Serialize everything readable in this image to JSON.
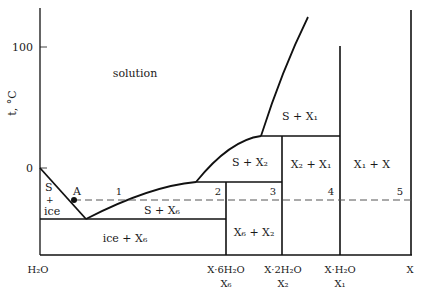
{
  "diagram": {
    "type": "phase-diagram",
    "axis": {
      "y_label": "t, °C",
      "y_ticks": [
        {
          "label": "100",
          "value": 100
        },
        {
          "label": "0",
          "value": 0
        }
      ],
      "x_labels": [
        {
          "formula": "H₂O",
          "symbol": ""
        },
        {
          "formula": "X·6H₂O",
          "symbol": "X₆"
        },
        {
          "formula": "X·2H₂O",
          "symbol": "X₂"
        },
        {
          "formula": "X·H₂O",
          "symbol": "X₁"
        },
        {
          "formula": "X",
          "symbol": ""
        }
      ]
    },
    "regions": {
      "solution": "solution",
      "s_ice_1": "S",
      "s_ice_2": "+",
      "s_ice_3": "ice",
      "ice_x6": "ice + X₆",
      "s_x6": "S + X₆",
      "s_x2": "S + X₂",
      "s_x1": "S + X₁",
      "x6_x2": "X₆ + X₂",
      "x2_x1": "X₂ + X₁",
      "x1_x": "X₁ + X"
    },
    "points": {
      "A": "A",
      "p1": "1",
      "p2": "2",
      "p3": "3",
      "p4": "4",
      "p5": "5"
    },
    "colors": {
      "line": "#111111",
      "dash": "#555555",
      "text": "#1a1a1a"
    }
  }
}
